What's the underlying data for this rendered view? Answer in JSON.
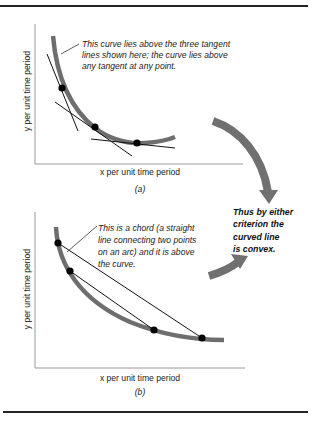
{
  "colors": {
    "rule": "#222222",
    "axis": "#9a9a9a",
    "curve": "#6e6e6e",
    "line": "#111111",
    "point": "#000000",
    "arrow": "#707070"
  },
  "panel_a": {
    "id_label": "(a)",
    "xlabel": "x per unit time period",
    "ylabel": "y per unit time period",
    "annotation": [
      "This curve lies above the three tangent",
      "lines shown here; the curve lies above",
      "any tangent at any point."
    ],
    "tangent_points": 3,
    "tangent_lines": 3
  },
  "panel_b": {
    "id_label": "(b)",
    "xlabel": "x per unit time period",
    "ylabel": "y per unit time period",
    "annotation": [
      "This is a chord (a straight",
      "line connecting two points",
      "on an arc) and it is above",
      "the curve."
    ],
    "chord_points": 4,
    "chords": 2
  },
  "conclusion": [
    "Thus by either",
    "criterion the",
    "curved line",
    "is convex."
  ]
}
